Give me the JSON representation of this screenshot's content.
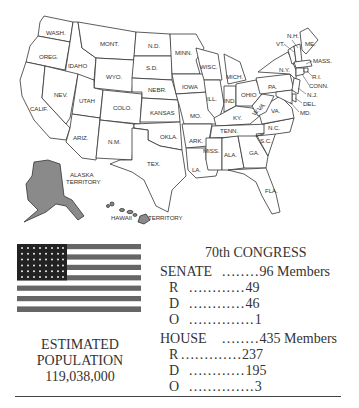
{
  "map": {
    "states": [
      "WASH.",
      "OREG.",
      "CALIF.",
      "IDAHO",
      "NEV.",
      "MONT.",
      "WYO.",
      "UTAH",
      "ARIZ.",
      "COLO.",
      "N.M.",
      "N.D.",
      "S.D.",
      "NEBR.",
      "KANSAS",
      "OKLA.",
      "TEX.",
      "MINN.",
      "IOWA",
      "MO.",
      "ARK.",
      "LA.",
      "WISC.",
      "ILL.",
      "MISS.",
      "MICH.",
      "IND.",
      "KY.",
      "TENN.",
      "ALA.",
      "OHIO",
      "W.VA.",
      "GA.",
      "FLA.",
      "PA.",
      "VA.",
      "N.C.",
      "S.C.",
      "N.Y.",
      "VT.",
      "N.H.",
      "ME.",
      "MASS.",
      "R.I.",
      "CONN.",
      "N.J.",
      "DEL.",
      "MD."
    ],
    "territories": {
      "alaska": "ALASKA\nTERRITORY",
      "alaska_line1": "ALASKA",
      "alaska_line2": "TERRITORY",
      "hawaii_left": "HAWAII",
      "hawaii_right": "TERRITORY"
    },
    "territory_fill": "#8a8a8a"
  },
  "flag": {
    "stars": 48,
    "stripes": 13
  },
  "population": {
    "line1": "ESTIMATED",
    "line2": "POPULATION",
    "value": "119,038,000"
  },
  "congress": {
    "title": "70th CONGRESS",
    "senate": {
      "label": "SENATE",
      "dots": "........",
      "total": "96 Members",
      "parties": [
        {
          "party": "R",
          "dots": "............",
          "count": "49"
        },
        {
          "party": "D",
          "dots": "............",
          "count": "46"
        },
        {
          "party": "O",
          "dots": "..............",
          "count": "1"
        }
      ]
    },
    "house": {
      "label": "HOUSE",
      "dots": "........",
      "total": "435 Members",
      "parties": [
        {
          "party": "R",
          "dots": ".............",
          "count": "237"
        },
        {
          "party": "D",
          "dots": "............",
          "count": "195"
        },
        {
          "party": "O",
          "dots": "..............",
          "count": "3"
        }
      ]
    }
  }
}
